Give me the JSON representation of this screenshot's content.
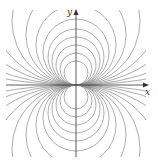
{
  "diagram": {
    "type": "field-lines",
    "origin_px": [
      76,
      85
    ],
    "axes": {
      "x_label": "x",
      "y_label": "y"
    },
    "circle_radii_px": [
      12,
      16,
      20,
      24,
      28,
      33,
      40,
      50,
      64,
      88,
      130,
      220,
      420
    ],
    "colors": {
      "curve": "#8a8a8a",
      "axis": "#333333",
      "background": "#ffffff"
    }
  }
}
